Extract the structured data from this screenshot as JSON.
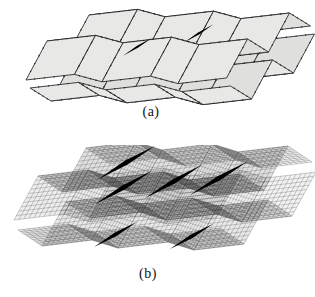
{
  "figure": {
    "subfigures": [
      {
        "label": "(a)"
      },
      {
        "label": "(b)"
      }
    ]
  },
  "colors": {
    "background": "#ffffff",
    "facet_fill_light": "#e8e8e6",
    "facet_fill_dark": "#dfdfdd",
    "edge": "#2c2c2c",
    "node_dot": "#1f1f1f",
    "mesh_line": "#3c3c3c",
    "slit": "#000000",
    "label_text": "#111111"
  }
}
